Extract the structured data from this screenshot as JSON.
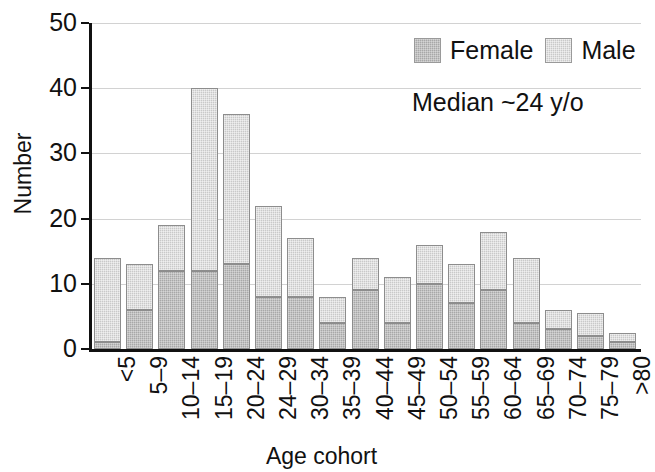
{
  "chart_data": {
    "type": "bar",
    "subtype": "stacked-bar",
    "title": "",
    "xlabel": "Age cohort",
    "ylabel": "Number",
    "ylim": [
      0,
      50
    ],
    "yticks": [
      0,
      10,
      20,
      30,
      40,
      50
    ],
    "grid": true,
    "legend_position": "top-right",
    "categories": [
      "<5",
      "5–9",
      "10–14",
      "15–19",
      "20–24",
      "24–29",
      "30–34",
      "35–39",
      "40–44",
      "45–49",
      "50–54",
      "55–59",
      "60–64",
      "65–69",
      "70–74",
      "75–79",
      ">80"
    ],
    "series": [
      {
        "name": "Female",
        "color": "#a8a8a8",
        "values": [
          1,
          6,
          12,
          12,
          13,
          8,
          8,
          4,
          9,
          4,
          10,
          7,
          9,
          4,
          3,
          2,
          1
        ]
      },
      {
        "name": "Male",
        "color": "#c9c9c9",
        "values": [
          13,
          7,
          7,
          28,
          23,
          14,
          9,
          4,
          5,
          7,
          6,
          6,
          9,
          10,
          3,
          3.5,
          1.5
        ]
      }
    ],
    "totals": [
      14,
      13,
      19,
      40,
      36,
      22,
      17,
      8,
      14,
      11,
      16,
      13,
      18,
      14,
      6,
      5.5,
      2.5
    ],
    "annotations": [
      {
        "text": "Median ~24 y/o"
      }
    ]
  },
  "legend": {
    "entries": [
      {
        "label": "Female"
      },
      {
        "label": "Male"
      }
    ]
  },
  "axes": {
    "y_title": "Number",
    "x_title": "Age cohort",
    "y_tick_labels": [
      "50",
      "40",
      "30",
      "20",
      "10",
      "0"
    ]
  },
  "notes": {
    "median": "Median ~24 y/o"
  }
}
